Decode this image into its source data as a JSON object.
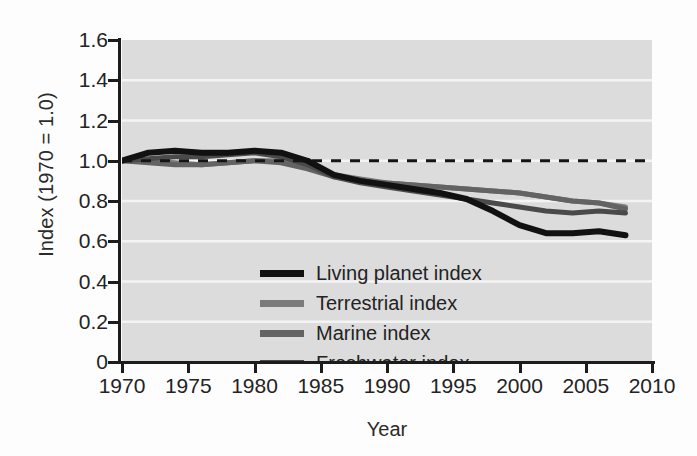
{
  "chart_data": {
    "type": "line",
    "title": "",
    "xlabel": "Year",
    "ylabel": "Index (1970 = 1.0)",
    "xlim": [
      1970,
      2010
    ],
    "ylim": [
      0,
      1.6
    ],
    "grid": true,
    "legend_position": "inside-lower-left",
    "xticks": [
      "1970",
      "1975",
      "1980",
      "1985",
      "1990",
      "1995",
      "2000",
      "2005",
      "2010"
    ],
    "yticks": [
      "0",
      "0.2",
      "0.4",
      "0.6",
      "0.8",
      "1.0",
      "1.2",
      "1.4",
      "1.6"
    ],
    "reference_line": {
      "label": "1.0 baseline",
      "value": 1.0,
      "style": "dashed",
      "color": "#141414"
    },
    "x": [
      1970,
      1972,
      1974,
      1976,
      1978,
      1980,
      1982,
      1984,
      1986,
      1988,
      1990,
      1992,
      1994,
      1996,
      1998,
      2000,
      2002,
      2004,
      2006,
      2008
    ],
    "series": [
      {
        "name": "Living planet index",
        "color": "#111111",
        "values": [
          1.0,
          1.04,
          1.05,
          1.04,
          1.04,
          1.05,
          1.04,
          1.0,
          0.93,
          0.9,
          0.88,
          0.86,
          0.84,
          0.81,
          0.75,
          0.68,
          0.64,
          0.64,
          0.65,
          0.63
        ]
      },
      {
        "name": "Terrestrial index",
        "color": "#7b7b7b",
        "values": [
          1.0,
          1.0,
          0.99,
          0.98,
          0.99,
          1.0,
          1.0,
          0.97,
          0.93,
          0.91,
          0.89,
          0.88,
          0.87,
          0.86,
          0.85,
          0.84,
          0.82,
          0.8,
          0.79,
          0.77
        ]
      },
      {
        "name": "Marine index",
        "color": "#636363",
        "values": [
          1.0,
          0.99,
          0.98,
          0.98,
          0.99,
          1.0,
          0.99,
          0.96,
          0.92,
          0.9,
          0.89,
          0.88,
          0.87,
          0.86,
          0.85,
          0.84,
          0.82,
          0.8,
          0.79,
          0.76
        ]
      },
      {
        "name": "Freshwater index",
        "color": "#4a4a4a",
        "values": [
          1.0,
          1.01,
          1.02,
          1.02,
          1.03,
          1.04,
          1.02,
          0.98,
          0.92,
          0.89,
          0.87,
          0.85,
          0.83,
          0.81,
          0.79,
          0.77,
          0.75,
          0.74,
          0.75,
          0.74
        ]
      }
    ]
  },
  "legend": {
    "entries": [
      {
        "label": "Living planet index",
        "color": "#111111"
      },
      {
        "label": "Terrestrial index",
        "color": "#7b7b7b"
      },
      {
        "label": "Marine index",
        "color": "#636363"
      },
      {
        "label": "Freshwater index",
        "color": "#4a4a4a"
      }
    ]
  },
  "colors": {
    "plot_background": "#dcdcdc",
    "figure_background": "#fdfdfd",
    "gridline": "#f4f4f4",
    "axis": "#1c1c1c",
    "text": "#232323"
  }
}
